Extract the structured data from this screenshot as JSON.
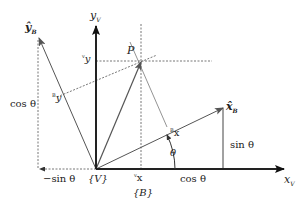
{
  "diagram": {
    "frames": {
      "V_label": "{V}",
      "B_label": "{B}"
    },
    "axes": {
      "x_V": "x",
      "x_V_sub": "V",
      "y_V": "y",
      "y_V_sub": "V",
      "x_B_hat": "x̂",
      "x_B_sub": "B",
      "y_B_hat": "ŷ",
      "y_B_sub": "B"
    },
    "point": {
      "label": "P"
    },
    "components": {
      "vx": "x",
      "vx_pre": "v",
      "vy": "y",
      "vy_pre": "v",
      "bx": "x",
      "bx_pre": "B",
      "by": "y",
      "by_pre": "B"
    },
    "projections": {
      "cos_theta_vertical": "cos θ",
      "neg_sin_theta": "−sin θ",
      "sin_theta": "sin θ",
      "cos_theta_horizontal": "cos θ"
    },
    "angle": {
      "label": "θ"
    },
    "colors": {
      "axis": "#222222",
      "vector": "#555555",
      "dashed": "#777777"
    }
  }
}
